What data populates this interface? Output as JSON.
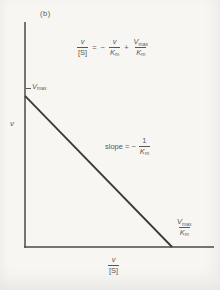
{
  "figure": {
    "panel_label": "(b)",
    "y_axis_label": "v",
    "equation": {
      "lhs_num": "v",
      "lhs_den": "[S]",
      "equals": "=",
      "minus": "−",
      "t1_num": "v",
      "t1_den_base": "K",
      "t1_den_sub": "m",
      "plus": "+",
      "t2_num_base": "V",
      "t2_num_sub": "max",
      "t2_den_base": "K",
      "t2_den_sub": "m"
    },
    "slope_prefix": "slope = −",
    "slope_num": "1",
    "slope_den_base": "K",
    "slope_den_sub": "m",
    "y_intercept_base": "V",
    "y_intercept_sub": "max",
    "x_intercept_num_base": "V",
    "x_intercept_num_sub": "max",
    "x_intercept_den_base": "K",
    "x_intercept_den_sub": "m",
    "x_axis_label_num": "v",
    "x_axis_label_den": "[S]"
  },
  "chart_data": {
    "type": "line",
    "title": "",
    "xlabel": "v/[S]",
    "ylabel": "v",
    "xlim": [
      0,
      1.285
    ],
    "ylim": [
      0,
      1.49
    ],
    "grid": false,
    "legend": false,
    "series": [
      {
        "name": "Eadie-Hofstee line",
        "x": [
          0,
          1.0
        ],
        "y": [
          1.0,
          0.0
        ],
        "x_units": "Vmax/Km",
        "y_units": "Vmax"
      }
    ],
    "annotations": [
      {
        "text": "slope = -1/Km",
        "position": "middle-right-of-line"
      },
      {
        "text": "Vmax",
        "position": "y-intercept"
      },
      {
        "text": "Vmax/Km",
        "position": "x-intercept"
      }
    ]
  },
  "colors": {
    "bg": "#f7f6f2",
    "ink": "#5a5852",
    "axis": "#4c4a46",
    "line": "#3b3a37"
  }
}
